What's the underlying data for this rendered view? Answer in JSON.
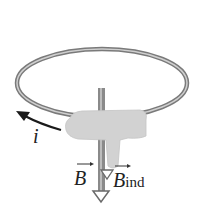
{
  "figure": {
    "labels": {
      "current": "i",
      "field": "B",
      "induced_field_base": "B",
      "induced_field_sub": "ind"
    },
    "colors": {
      "loop": "#8c8c8c",
      "loop_highlight": "#d0d0d0",
      "hand": "#cfcfcf",
      "rod": "#8a8a8a",
      "arrow": "#1a1a1a",
      "text": "#222222"
    }
  }
}
